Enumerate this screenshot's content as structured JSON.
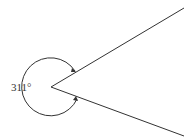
{
  "diagram": {
    "type": "angle",
    "angle_label": "311°",
    "angle_degrees": 311,
    "vertex": [
      51,
      87
    ],
    "ray_upper_end": [
      184,
      8
    ],
    "ray_lower_end": [
      184,
      136
    ],
    "line_color": "#333333"
  }
}
